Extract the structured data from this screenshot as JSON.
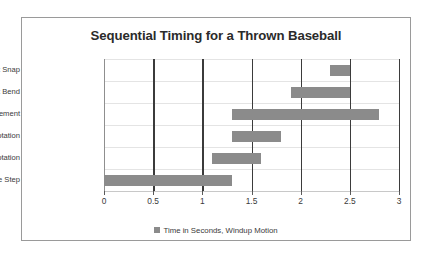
{
  "chart_data": {
    "type": "bar",
    "orientation": "horizontal",
    "subtype": "gantt-range",
    "title": "Sequential Timing for a Thrown Baseball",
    "xlabel": "",
    "ylabel": "",
    "xlim": [
      0,
      3
    ],
    "xticks": [
      "0",
      "0.5",
      "1",
      "1.5",
      "2",
      "2.5",
      "3"
    ],
    "xtick_values": [
      0,
      0.5,
      1,
      1.5,
      2,
      2.5,
      3
    ],
    "grid": "both",
    "legend_position": "bottom",
    "legend": [
      "Time in Seconds, Windup Motion"
    ],
    "series_color": "#8b8b8b",
    "categories": [
      "Wrist Snap",
      "Waist Bend",
      "Arm Movement",
      "Shoulder Rotation",
      "Hip Rotation",
      "Stride Step"
    ],
    "bars": [
      {
        "category": "Wrist Snap",
        "start": 2.3,
        "end": 2.5,
        "duration": 0.2
      },
      {
        "category": "Waist Bend",
        "start": 1.9,
        "end": 2.5,
        "duration": 0.6
      },
      {
        "category": "Arm Movement",
        "start": 1.3,
        "end": 2.8,
        "duration": 1.5
      },
      {
        "category": "Shoulder Rotation",
        "start": 1.3,
        "end": 1.8,
        "duration": 0.5
      },
      {
        "category": "Hip Rotation",
        "start": 1.1,
        "end": 1.6,
        "duration": 0.5
      },
      {
        "category": "Stride Step",
        "start": 0.0,
        "end": 1.3,
        "duration": 1.3
      }
    ]
  },
  "legend": {
    "swatch_icon": "square-swatch-icon",
    "label": "Time in Seconds, Windup Motion"
  }
}
